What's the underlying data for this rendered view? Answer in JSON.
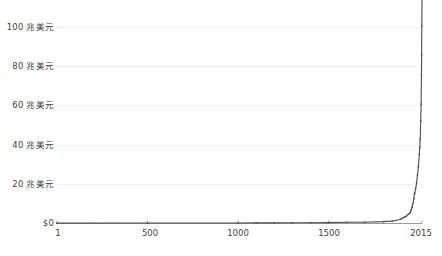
{
  "chart_data": {
    "type": "line",
    "title": "",
    "subtitle": "",
    "xlabel": "",
    "ylabel": "",
    "xlim": [
      1,
      2015
    ],
    "ylim": [
      0,
      110
    ],
    "grid": true,
    "legend": null,
    "y_unit_suffix": "兆美元",
    "y_ticks": [
      {
        "value": 0,
        "label": "$0"
      },
      {
        "value": 20,
        "label": "20 兆美元"
      },
      {
        "value": 40,
        "label": "40 兆美元"
      },
      {
        "value": 60,
        "label": "60 兆美元"
      },
      {
        "value": 80,
        "label": "80 兆美元"
      },
      {
        "value": 100,
        "label": "100 兆美元"
      }
    ],
    "x_ticks": [
      {
        "value": 1,
        "label": "1"
      },
      {
        "value": 500,
        "label": "500"
      },
      {
        "value": 1000,
        "label": "1000"
      },
      {
        "value": 1500,
        "label": "1500"
      },
      {
        "value": 2015,
        "label": "2015"
      }
    ],
    "series": [
      {
        "name": "",
        "color": "#4d4d4d",
        "marker": "dot",
        "x": [
          1,
          500,
          1000,
          1100,
          1200,
          1300,
          1400,
          1500,
          1600,
          1700,
          1800,
          1850,
          1870,
          1900,
          1913,
          1920,
          1930,
          1940,
          1950,
          1955,
          1960,
          1965,
          1970,
          1973,
          1975,
          1980,
          1985,
          1990,
          1995,
          2000,
          2003,
          2005,
          2008,
          2010,
          2012,
          2013,
          2014,
          2015
        ],
        "values": [
          0.18,
          0.21,
          0.25,
          0.28,
          0.32,
          0.35,
          0.34,
          0.43,
          0.58,
          0.64,
          0.9,
          1.15,
          1.45,
          2.2,
          2.9,
          3.1,
          3.7,
          4.5,
          5.3,
          6.5,
          7.9,
          9.7,
          12.1,
          14.2,
          14.8,
          17.0,
          19.6,
          23.5,
          27.5,
          33.5,
          37.0,
          41.0,
          50.0,
          58.0,
          72.0,
          82.0,
          96.0,
          110.0
        ]
      }
    ]
  }
}
